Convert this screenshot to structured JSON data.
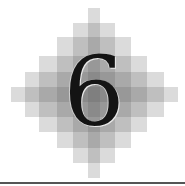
{
  "chapter_number": "6",
  "decoration": {
    "type": "stepped-diamond",
    "bars": [
      {
        "x": 88,
        "y": 8,
        "w": 12,
        "h": 170
      },
      {
        "x": 73,
        "y": 23,
        "w": 42,
        "h": 140
      },
      {
        "x": 57,
        "y": 37,
        "w": 74,
        "h": 111
      },
      {
        "x": 39,
        "y": 56,
        "w": 108,
        "h": 76
      },
      {
        "x": 25,
        "y": 72,
        "w": 139,
        "h": 45
      },
      {
        "x": 11,
        "y": 87,
        "w": 167,
        "h": 15
      }
    ],
    "bar_color": "#5a5a5a"
  },
  "rule_color": "#555555"
}
